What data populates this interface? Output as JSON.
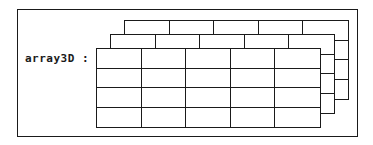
{
  "diagram": {
    "label": "array3D :",
    "border_color": "#1a1a1a",
    "background_color": "#ffffff",
    "line_color": "#1a1a1a",
    "structure": {
      "type": "3d-array-grid",
      "layers": 3,
      "columns": 5,
      "rows": 4,
      "layer_offset_x": 14,
      "layer_offset_y": -14,
      "cell_width": 45,
      "cell_height": 20,
      "front_layer_left": 96,
      "front_layer_top": 48
    },
    "frame": {
      "left": 17,
      "top": 9,
      "width": 341,
      "height": 128
    }
  }
}
